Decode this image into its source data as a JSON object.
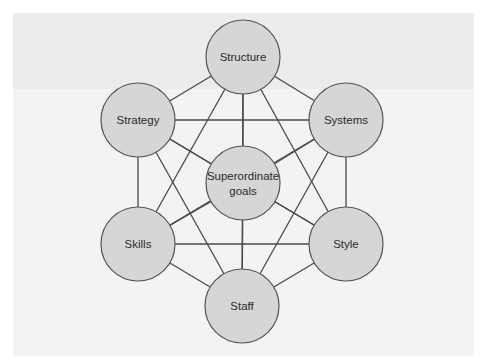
{
  "diagram": {
    "title": "",
    "type": "complete-graph",
    "colors": {
      "circle_fill": "#d6d6d6",
      "circle_stroke": "#555555",
      "edge": "#4a4a4a",
      "background_panel": "#f3f3f3",
      "background_band": "#ececec"
    },
    "nodes": [
      {
        "id": "structure",
        "label": "Structure",
        "cx": 243,
        "cy": 57,
        "r": 37
      },
      {
        "id": "strategy",
        "label": "Strategy",
        "cx": 138,
        "cy": 120,
        "r": 37
      },
      {
        "id": "systems",
        "label": "Systems",
        "cx": 346,
        "cy": 120,
        "r": 37
      },
      {
        "id": "superordinate-goals",
        "label": "Superordinate",
        "label2": "goals",
        "cx": 243,
        "cy": 183,
        "r": 37
      },
      {
        "id": "skills",
        "label": "Skills",
        "cx": 138,
        "cy": 244,
        "r": 37
      },
      {
        "id": "style",
        "label": "Style",
        "cx": 346,
        "cy": 244,
        "r": 37
      },
      {
        "id": "staff",
        "label": "Staff",
        "cx": 242,
        "cy": 306,
        "r": 37
      }
    ],
    "edges": "all-pairs"
  }
}
